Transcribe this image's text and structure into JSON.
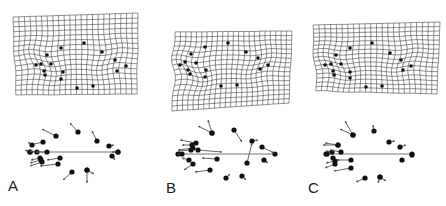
{
  "figure": {
    "panels": [
      {
        "label": "A",
        "label_pos": [
          8,
          178
        ],
        "grid": {
          "corners": {
            "tl": [
              13,
              17
            ],
            "tr": [
              138,
              13
            ],
            "br": [
              137,
              94
            ],
            "bl": [
              16,
              95
            ]
          },
          "cols": 22,
          "rows": 16,
          "warp": [
            {
              "cx": 42,
              "cy": 62,
              "amp": 4
            },
            {
              "cx": 110,
              "cy": 60,
              "amp": -3
            }
          ]
        },
        "landmarks": [
          [
            36,
            65
          ],
          [
            41,
            64
          ],
          [
            47,
            55
          ],
          [
            44,
            71
          ],
          [
            45,
            75
          ],
          [
            51,
            64
          ],
          [
            61,
            48
          ],
          [
            63,
            72
          ],
          [
            61,
            79
          ],
          [
            84,
            43
          ],
          [
            102,
            52
          ],
          [
            115,
            60
          ],
          [
            117,
            71
          ],
          [
            126,
            66
          ],
          [
            77,
            88
          ],
          [
            93,
            86
          ]
        ],
        "vectors": {
          "baseline": {
            "x1": 30,
            "x2": 118,
            "y": 152
          },
          "arrows": [
            [
              56,
              136,
              42,
              129
            ],
            [
              78,
              132,
              70,
              123
            ],
            [
              97,
              141,
              92,
              131
            ],
            [
              109,
              146,
              114,
              145
            ],
            [
              118,
              152,
              112,
              152
            ],
            [
              112,
              156,
              115,
              160
            ],
            [
              43,
              142,
              30,
              145
            ],
            [
              32,
              145,
              28,
              142
            ],
            [
              30,
              152,
              25,
              150
            ],
            [
              37,
              152,
              30,
              151
            ],
            [
              47,
              152,
              36,
              152
            ],
            [
              40,
              158,
              31,
              160
            ],
            [
              41,
              160,
              30,
              163
            ],
            [
              42,
              162,
              30,
              166
            ],
            [
              60,
              158,
              47,
              160
            ],
            [
              58,
              164,
              40,
              166
            ],
            [
              72,
              172,
              63,
              180
            ],
            [
              87,
              170,
              94,
              174
            ],
            [
              87,
              170,
              87,
              183
            ]
          ]
        }
      },
      {
        "label": "B",
        "label_pos": [
          166,
          180
        ],
        "grid": {
          "corners": {
            "tl": [
              175,
              32
            ],
            "tr": [
              292,
              31
            ],
            "br": [
              289,
              103
            ],
            "bl": [
              172,
              111
            ]
          },
          "cols": 22,
          "rows": 16,
          "warp": [
            {
              "cx": 190,
              "cy": 70,
              "amp": 5
            },
            {
              "cx": 260,
              "cy": 65,
              "amp": -3
            }
          ]
        },
        "landmarks": [
          [
            180,
            65
          ],
          [
            185,
            62
          ],
          [
            191,
            54
          ],
          [
            188,
            70
          ],
          [
            190,
            74
          ],
          [
            196,
            63
          ],
          [
            205,
            47
          ],
          [
            206,
            70
          ],
          [
            205,
            77
          ],
          [
            228,
            43
          ],
          [
            246,
            52
          ],
          [
            258,
            58
          ],
          [
            260,
            69
          ],
          [
            268,
            65
          ],
          [
            221,
            86
          ],
          [
            237,
            85
          ]
        ],
        "vectors": {
          "baseline": {
            "x1": 178,
            "x2": 275,
            "y": 154
          },
          "arrows": [
            [
              212,
              133,
              198,
              126
            ],
            [
              212,
              133,
              208,
              120
            ],
            [
              234,
              130,
              242,
              142
            ],
            [
              252,
              141,
              258,
              140
            ],
            [
              262,
              147,
              274,
              153
            ],
            [
              264,
              160,
              268,
              163
            ],
            [
              247,
              163,
              252,
              143
            ],
            [
              196,
              143,
              180,
              140
            ],
            [
              192,
              145,
              182,
              145
            ],
            [
              193,
              148,
              178,
              150
            ],
            [
              191,
              150,
              178,
              151
            ],
            [
              198,
              150,
              222,
              152
            ],
            [
              217,
              159,
              202,
              158
            ],
            [
              189,
              160,
              182,
              158
            ],
            [
              193,
              164,
              184,
              170
            ],
            [
              210,
              170,
              195,
              172
            ],
            [
              226,
              178,
              230,
              174
            ],
            [
              242,
              176,
              246,
              180
            ],
            [
              182,
              154,
              178,
              154
            ]
          ]
        }
      },
      {
        "label": "C",
        "label_pos": [
          308,
          180
        ],
        "grid": {
          "corners": {
            "tl": [
              313,
              25
            ],
            "tr": [
              440,
              22
            ],
            "br": [
              437,
              94
            ],
            "bl": [
              316,
              91
            ]
          },
          "cols": 22,
          "rows": 16,
          "warp": [
            {
              "cx": 335,
              "cy": 65,
              "amp": 4
            },
            {
              "cx": 405,
              "cy": 60,
              "amp": -3
            }
          ]
        },
        "landmarks": [
          [
            325,
            65
          ],
          [
            331,
            64
          ],
          [
            336,
            55
          ],
          [
            333,
            71
          ],
          [
            334,
            75
          ],
          [
            341,
            64
          ],
          [
            350,
            48
          ],
          [
            350,
            72
          ],
          [
            350,
            78
          ],
          [
            372,
            43
          ],
          [
            390,
            53
          ],
          [
            401,
            60
          ],
          [
            403,
            70
          ],
          [
            411,
            66
          ],
          [
            366,
            87
          ],
          [
            382,
            86
          ]
        ],
        "vectors": {
          "baseline": {
            "x1": 326,
            "x2": 412,
            "y": 154
          },
          "arrows": [
            [
              353,
              135,
              340,
              129
            ],
            [
              353,
              135,
              345,
              121
            ],
            [
              374,
              131,
              373,
              125
            ],
            [
              389,
              142,
              395,
              141
            ],
            [
              400,
              147,
              406,
              145
            ],
            [
              338,
              145,
              323,
              145
            ],
            [
              338,
              145,
              325,
              143
            ],
            [
              332,
              152,
              326,
              151
            ],
            [
              341,
              152,
              330,
              150
            ],
            [
              333,
              158,
              331,
              156
            ],
            [
              335,
              161,
              326,
              163
            ],
            [
              335,
              164,
              325,
              168
            ],
            [
              351,
              160,
              337,
              160
            ],
            [
              351,
              168,
              334,
              171
            ],
            [
              365,
              178,
              356,
              182
            ],
            [
              380,
              177,
              386,
              181
            ],
            [
              380,
              177,
              378,
              183
            ]
          ],
          "dots": [
            [
              412,
              155
            ],
            [
              402,
              160
            ],
            [
              327,
              154
            ]
          ]
        }
      }
    ],
    "colors": {
      "grid": "#444444",
      "landmark": "#111111",
      "arrow": "#555555",
      "baseline": "#666666"
    }
  }
}
